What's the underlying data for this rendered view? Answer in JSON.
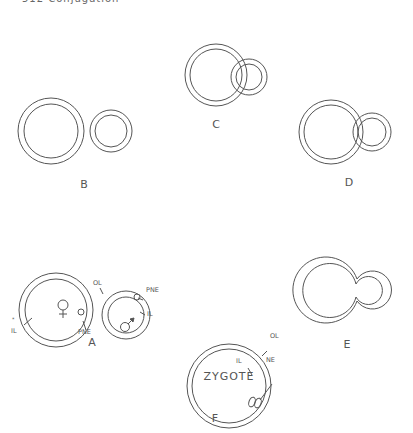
{
  "header": {
    "text": "512   Conjugation"
  },
  "panels": {
    "A": {
      "label": "A",
      "annotations": [
        "OL",
        "PNE",
        "IL",
        "IL",
        "PNE",
        "♀",
        "♂",
        "*"
      ]
    },
    "B": {
      "label": "B"
    },
    "C": {
      "label": "C"
    },
    "D": {
      "label": "D"
    },
    "E": {
      "label": "E"
    },
    "F": {
      "label": "F",
      "center_text": "ZYGOTE",
      "annotations": [
        "OL",
        "IL",
        "NE"
      ]
    }
  },
  "labels": {
    "ol_a": "OL",
    "pne_a_right": "PNE",
    "il_a_right": "IL",
    "il_a_left": "IL",
    "pne_a_left": "PNE",
    "female": "♀",
    "male": "♂",
    "asterisk": "*",
    "ol_f": "OL",
    "il_f": "IL",
    "ne_f": "NE"
  },
  "colors": {
    "line": "#555555",
    "text": "#555555",
    "background": "#ffffff"
  }
}
